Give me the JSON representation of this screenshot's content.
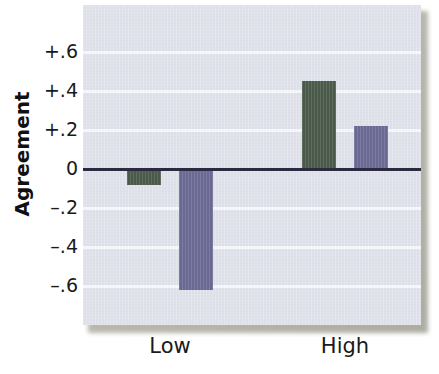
{
  "figure": {
    "y_axis_title": "Agreement",
    "panel_background": "#dcdfe8",
    "zero_line_color": "#2a2a40",
    "gridline_color": "#f4f6fa"
  },
  "chart_data": {
    "type": "bar",
    "title": "",
    "xlabel": "",
    "ylabel": "Agreement",
    "categories": [
      "Low",
      "High"
    ],
    "series": [
      {
        "name": "series-green",
        "color": "#4d5d4c",
        "values": [
          -0.08,
          0.45
        ]
      },
      {
        "name": "series-purple",
        "color": "#6d6d98",
        "values": [
          -0.62,
          0.22
        ]
      }
    ],
    "ylim": [
      -0.7,
      0.7
    ],
    "yticks": [
      0.6,
      0.4,
      0.2,
      0.0,
      -0.2,
      -0.4,
      -0.6
    ],
    "ytick_labels": [
      "+.6",
      "+.4",
      "+.2",
      "0",
      "–.2",
      "–.4",
      "–.6"
    ],
    "grid": true,
    "legend": "none"
  }
}
